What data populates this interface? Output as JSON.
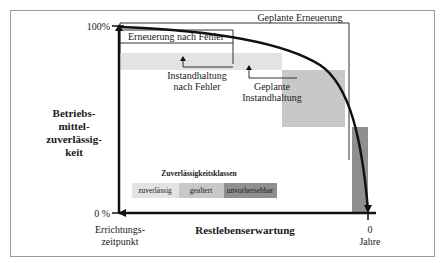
{
  "diagram": {
    "y_axis": {
      "label_lines": [
        "Betriebs-",
        "mittel-",
        "zuverlässig-",
        "keit"
      ],
      "top_tick": "100%",
      "bottom_tick": "0 %"
    },
    "x_axis": {
      "label": "Restlebenserwartung",
      "left_lines": [
        "Errichtungs-",
        "zeitpunkt"
      ],
      "right_lines": [
        "0",
        "Jahre"
      ]
    },
    "brackets": {
      "renewal_after_failure": "Erneuerung nach Fehler",
      "planned_renewal": "Geplante Erneuerung",
      "maintenance_after_failure": [
        "Instandhaltung",
        "nach Fehler"
      ],
      "planned_maintenance": [
        "Geplante",
        "Instandhaltung"
      ]
    },
    "legend": {
      "title": "Zuverlässigkeitsklassen",
      "items": [
        {
          "label": "zuverlässig",
          "color": "#e3e3e3"
        },
        {
          "label": "gealtert",
          "color": "#c8c8c8"
        },
        {
          "label": "unvorhersehbar",
          "color": "#8f8f8f"
        }
      ]
    },
    "colors": {
      "frame": "#9a9a9a",
      "axis": "#111111",
      "bracket": "#333333",
      "zone_reliable": "#e3e3e3",
      "zone_aged": "#c8c8c8",
      "zone_unpredictable": "#8f8f8f"
    }
  }
}
